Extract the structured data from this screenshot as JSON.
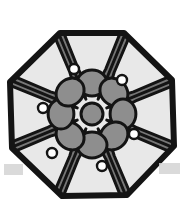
{
  "artwork": {
    "title": "Octagonal Quilt Block Motif",
    "caption": "",
    "medium": "black-and-white line illustration",
    "background_color": "#ffffff",
    "canvas": {
      "width": 185,
      "height": 211
    }
  },
  "palette": {
    "outline": "#141414",
    "dark_gray": "#777777",
    "mid_gray": "#8e8e8e",
    "light_gray": "#d3d3d3",
    "petal_light": "#e8e8e8",
    "white": "#ffffff"
  },
  "octagon": {
    "name": "outer-octagon-border",
    "stroke_color": "#141414",
    "stroke_width": 6,
    "fill": "#e8e8e8",
    "center": {
      "x": 92,
      "y": 114
    },
    "radius": 84,
    "rotation_degrees": 22.5,
    "sides": 8,
    "vertices": [
      {
        "x": 60,
        "y": 33
      },
      {
        "x": 124,
        "y": 33
      },
      {
        "x": 172,
        "y": 80
      },
      {
        "x": 174,
        "y": 146
      },
      {
        "x": 127,
        "y": 195
      },
      {
        "x": 62,
        "y": 196
      },
      {
        "x": 12,
        "y": 148
      },
      {
        "x": 10,
        "y": 82
      }
    ]
  },
  "center_rosette": {
    "name": "center-rosette",
    "petal_count": 8,
    "fill": "#8e8e8e",
    "stroke_color": "#141414",
    "center": {
      "x": 92,
      "y": 114
    },
    "petal_radius": 31,
    "petal_size": 15,
    "hub_radius": 11
  },
  "rays": {
    "name": "radial-spokes",
    "count": 8,
    "stroke_color": "#141414",
    "stroke_width": 3
  },
  "light_petals": {
    "name": "light-kite-petals",
    "count": 8,
    "fill": "#e8e8e8",
    "stroke_color": "#141414",
    "angles_degrees": [
      0,
      45,
      90,
      135,
      180,
      225,
      270,
      315
    ]
  },
  "dark_triangles": {
    "name": "dark-corner-triangles",
    "count": 8,
    "fill": "#777777",
    "stroke_color": "#141414",
    "angles_degrees": [
      22.5,
      67.5,
      112.5,
      157.5,
      202.5,
      247.5,
      292.5,
      337.5
    ]
  },
  "eyelets": {
    "name": "petal-eyelet-rings",
    "count": 6,
    "ring_color": "#141414",
    "hole_color": "#ffffff",
    "outer_radius": 5,
    "inner_radius": 2.6,
    "positions": [
      {
        "label": "eyelet-top",
        "x": 74,
        "y": 69
      },
      {
        "label": "eyelet-upper-right",
        "x": 122,
        "y": 80
      },
      {
        "label": "eyelet-left",
        "x": 43,
        "y": 108
      },
      {
        "label": "eyelet-right",
        "x": 134,
        "y": 134
      },
      {
        "label": "eyelet-lower-left",
        "x": 52,
        "y": 153
      },
      {
        "label": "eyelet-bottom",
        "x": 102,
        "y": 166
      }
    ]
  },
  "artifacts": {
    "name": "scan-edge-artifacts",
    "color": "#d3d3d3",
    "items": [
      {
        "label": "artifact-left",
        "x": 4,
        "y": 164,
        "width": 19,
        "height": 11
      },
      {
        "label": "artifact-right",
        "x": 159,
        "y": 163,
        "width": 21,
        "height": 11
      }
    ]
  }
}
